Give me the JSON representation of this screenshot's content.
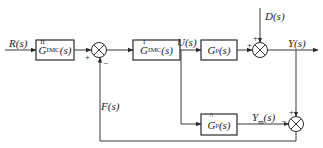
{
  "diagram": {
    "type": "internal-model-control block diagram",
    "signals": {
      "input": "R(s)",
      "control": "U(s)",
      "disturbance": "D(s)",
      "output": "Y(s)",
      "model_output": "Y_m(s)",
      "feedback": "F(s)"
    },
    "blocks": {
      "imc2": {
        "base": "G",
        "sub": "IMC",
        "sup": "II",
        "arg": "(s)"
      },
      "imc1": {
        "base": "G",
        "sub": "IMC",
        "sup": "I",
        "arg": "(s)"
      },
      "plant": {
        "base": "G",
        "sub": "p",
        "arg": "(s)"
      },
      "model": {
        "base": "G",
        "sub": "p",
        "hat": "^",
        "arg": "(s)"
      }
    },
    "labels": {
      "R": "R(s)",
      "U": "U(s)",
      "D": "D(s)",
      "Y": "Y(s)",
      "Ym_base": "Y",
      "Ym_sub": "m",
      "Ym_arg": "(s)",
      "F": "F(s)"
    },
    "signs": {
      "sum1_left": "+",
      "sum1_bottom": "−",
      "sum2_left": "+",
      "sum2_top": "+",
      "sum3_top": "+",
      "sum3_left": "−"
    },
    "colors": {
      "line": "#3a3a3a",
      "text": "#222222",
      "background": "#ffffff"
    }
  }
}
